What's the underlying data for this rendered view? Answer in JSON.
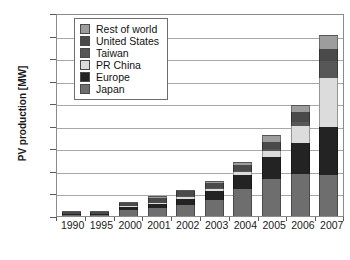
{
  "chart_data": {
    "type": "bar",
    "stacked": true,
    "title": "",
    "xlabel": "",
    "ylabel": "PV production [MW]",
    "ylim": [
      0,
      4500
    ],
    "ytick_labels": [
      "4.500",
      "4.000",
      "3.500",
      "3.000",
      "2.500",
      "2.000",
      "1.500",
      "1.000",
      "500",
      "0"
    ],
    "ytick_values": [
      4500,
      4000,
      3500,
      3000,
      2500,
      2000,
      1500,
      1000,
      500,
      0
    ],
    "grid": true,
    "legend_position": "upper-left-inside",
    "decimal_separator_note": "thousands separated by period",
    "categories": [
      "1990",
      "1995",
      "2000",
      "2001",
      "2002",
      "2003",
      "2004",
      "2005",
      "2006",
      "2007"
    ],
    "series": [
      {
        "name": "Japan",
        "color": "#6e6e6e",
        "values": [
          20,
          25,
          130,
          175,
          250,
          365,
          600,
          830,
          930,
          920
        ]
      },
      {
        "name": "Europe",
        "color": "#232323",
        "values": [
          10,
          15,
          60,
          90,
          135,
          200,
          310,
          470,
          690,
          1060
        ]
      },
      {
        "name": "PR China",
        "color": "#dcdcdc",
        "values": [
          0,
          0,
          5,
          10,
          20,
          30,
          60,
          135,
          370,
          1080
        ]
      },
      {
        "name": "Taiwan",
        "color": "#575757",
        "values": [
          0,
          0,
          0,
          0,
          5,
          10,
          20,
          45,
          105,
          370
        ]
      },
      {
        "name": "United States",
        "color": "#4a4a4a",
        "values": [
          15,
          20,
          75,
          100,
          120,
          105,
          140,
          155,
          205,
          275
        ]
      },
      {
        "name": "Rest of world",
        "color": "#9d9d9d",
        "values": [
          5,
          10,
          30,
          45,
          30,
          40,
          70,
          165,
          170,
          300
        ]
      }
    ]
  },
  "legend": {
    "items": [
      {
        "label": "Rest of world",
        "color": "#9d9d9d"
      },
      {
        "label": "United States",
        "color": "#4a4a4a"
      },
      {
        "label": "Taiwan",
        "color": "#575757"
      },
      {
        "label": "PR China",
        "color": "#dcdcdc"
      },
      {
        "label": "Europe",
        "color": "#232323"
      },
      {
        "label": "Japan",
        "color": "#6e6e6e"
      }
    ]
  }
}
